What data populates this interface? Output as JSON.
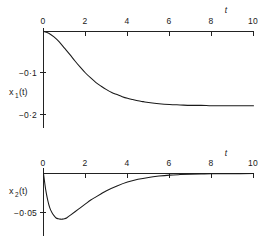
{
  "figure": {
    "title": "",
    "background": "#ffffff",
    "ink": "#1a1a1a"
  },
  "chart_data": [
    {
      "type": "line",
      "title": "",
      "subtitle": "",
      "xlabel": "t",
      "ylabel": "x₁(t)",
      "xlim": [
        0,
        10
      ],
      "ylim": [
        -0.22,
        0.0
      ],
      "grid": false,
      "legend": null,
      "xticks": [
        0,
        2,
        4,
        6,
        8,
        10
      ],
      "xticklabels": [
        "0",
        "2",
        "4",
        "6",
        "8",
        "10"
      ],
      "yticks": [
        -0.1,
        -0.2
      ],
      "yticklabels": [
        "−0·1",
        "−0·2"
      ],
      "series": [
        {
          "name": "x1",
          "x": [
            0.0,
            0.25,
            0.5,
            0.75,
            1.0,
            1.25,
            1.5,
            1.75,
            2.0,
            2.25,
            2.5,
            2.75,
            3.0,
            3.25,
            3.5,
            3.75,
            4.0,
            4.25,
            4.5,
            4.75,
            5.0,
            5.5,
            6.0,
            6.5,
            7.0,
            7.5,
            8.0,
            8.5,
            9.0,
            9.5,
            10.0
          ],
          "y": [
            0.0,
            -0.004,
            -0.013,
            -0.025,
            -0.04,
            -0.055,
            -0.071,
            -0.086,
            -0.1,
            -0.112,
            -0.123,
            -0.132,
            -0.14,
            -0.147,
            -0.152,
            -0.157,
            -0.161,
            -0.164,
            -0.167,
            -0.169,
            -0.171,
            -0.174,
            -0.176,
            -0.177,
            -0.178,
            -0.178,
            -0.179,
            -0.179,
            -0.179,
            -0.179,
            -0.179
          ]
        }
      ],
      "annotations": [
        "curve starts at origin, decays sigmoidally to an asymptote near -0.18"
      ]
    },
    {
      "type": "line",
      "title": "",
      "subtitle": "",
      "xlabel": "t",
      "ylabel": "x₂(t)",
      "xlim": [
        0,
        10
      ],
      "ylim": [
        -0.07,
        0.0
      ],
      "grid": false,
      "legend": null,
      "xticks": [
        0,
        2,
        4,
        6,
        8,
        10
      ],
      "xticklabels": [
        "0",
        "2",
        "4",
        "6",
        "8",
        "10"
      ],
      "yticks": [
        -0.05
      ],
      "yticklabels": [
        "−0·05"
      ],
      "series": [
        {
          "name": "x2",
          "x": [
            0.0,
            0.1,
            0.2,
            0.3,
            0.4,
            0.5,
            0.6,
            0.7,
            0.8,
            0.9,
            1.0,
            1.1,
            1.2,
            1.3,
            1.5,
            1.75,
            2.0,
            2.25,
            2.5,
            2.75,
            3.0,
            3.5,
            4.0,
            4.5,
            5.0,
            5.5,
            6.0,
            6.5,
            7.0,
            7.5,
            8.0,
            9.0,
            10.0
          ],
          "y": [
            0.0,
            -0.02,
            -0.034,
            -0.044,
            -0.05,
            -0.054,
            -0.057,
            -0.058,
            -0.0585,
            -0.0585,
            -0.058,
            -0.057,
            -0.055,
            -0.053,
            -0.049,
            -0.044,
            -0.039,
            -0.034,
            -0.03,
            -0.026,
            -0.022,
            -0.016,
            -0.011,
            -0.0075,
            -0.005,
            -0.0033,
            -0.0021,
            -0.0014,
            -0.0009,
            -0.0006,
            -0.0004,
            -0.0002,
            -0.0001
          ]
        }
      ],
      "annotations": [
        "sharp dip from origin to a minimum near t = 0.85, then slow recovery toward zero"
      ]
    }
  ],
  "panels": {
    "top": {
      "axis_title": "t",
      "y_label_main": "x",
      "y_label_sub": "1",
      "y_label_tail": "(t)",
      "xticklabels": [
        "0",
        "2",
        "4",
        "6",
        "8",
        "10"
      ],
      "yticklabels": [
        "−0·1",
        "−0·2"
      ]
    },
    "bottom": {
      "axis_title": "t",
      "y_label_main": "x",
      "y_label_sub": "2",
      "y_label_tail": "(t)",
      "xticklabels": [
        "0",
        "2",
        "4",
        "6",
        "8",
        "10"
      ],
      "yticklabels": [
        "−0·05"
      ]
    }
  }
}
